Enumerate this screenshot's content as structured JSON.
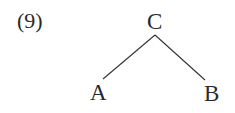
{
  "diagram": {
    "label": "(9)",
    "type": "tree",
    "nodes": {
      "root": "C",
      "left": "A",
      "right": "B"
    },
    "edges": [
      {
        "from": "C",
        "to": "A"
      },
      {
        "from": "C",
        "to": "B"
      }
    ],
    "colors": {
      "text": "#2a2a2a",
      "line": "#333333",
      "background": "#ffffff"
    }
  }
}
